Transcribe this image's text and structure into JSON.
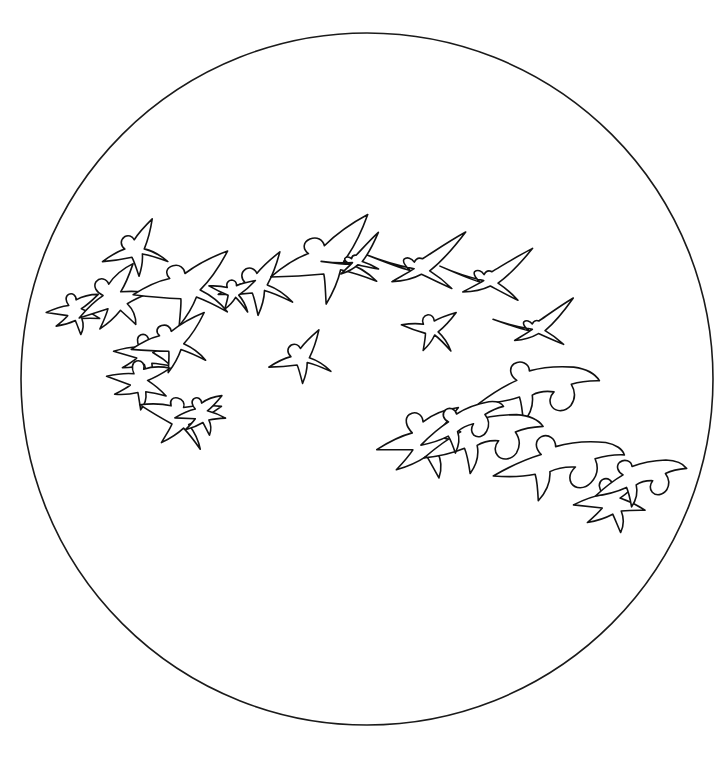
{
  "canvas": {
    "width": 728,
    "height": 763,
    "background_color": "#ffffff",
    "title": "Flock of birds seen through a circular field of view"
  },
  "field_of_view": {
    "name": "circular-viewfield",
    "shape": "circle",
    "center_x": 367,
    "center_y": 379,
    "radius": 346,
    "stroke_color": "#1a1a1a",
    "stroke_width": 1.6,
    "fill_color": "#ffffff"
  },
  "drawing": {
    "style": "hand-drawn ink outline",
    "stroke_color": "#111111",
    "stroke_width": 1.6,
    "fill_color": "#ffffff",
    "subject": "birds in flight",
    "bird_count": 25
  },
  "chart_data": {
    "type": "scatter",
    "xlabel": "",
    "ylabel": "",
    "xlim": [
      0,
      728
    ],
    "ylim": [
      0,
      763
    ],
    "grid": false,
    "legend": "none",
    "categories": [
      "bird"
    ],
    "annotations": [
      "circular field of view outline",
      "birds arranged in loose descending flock from left to right"
    ],
    "points": [
      {
        "id": "bird-01",
        "x": 136,
        "y": 256,
        "size": 42,
        "rotation": -18,
        "pose": "gull-soar",
        "flip": false
      },
      {
        "id": "bird-02",
        "x": 78,
        "y": 316,
        "size": 36,
        "rotation": 14,
        "pose": "goose-flap",
        "flip": false
      },
      {
        "id": "bird-03",
        "x": 121,
        "y": 303,
        "size": 50,
        "rotation": -12,
        "pose": "goose-flap",
        "flip": false
      },
      {
        "id": "bird-04",
        "x": 190,
        "y": 300,
        "size": 56,
        "rotation": -6,
        "pose": "gull-glide",
        "flip": false
      },
      {
        "id": "bird-05",
        "x": 257,
        "y": 292,
        "size": 48,
        "rotation": -12,
        "pose": "gull-soar",
        "flip": false
      },
      {
        "id": "bird-06",
        "x": 334,
        "y": 274,
        "size": 62,
        "rotation": -14,
        "pose": "gull-glide",
        "flip": false
      },
      {
        "id": "bird-07",
        "x": 421,
        "y": 271,
        "size": 54,
        "rotation": -8,
        "pose": "gull-thin",
        "flip": false
      },
      {
        "id": "bird-08",
        "x": 490,
        "y": 283,
        "size": 50,
        "rotation": -6,
        "pose": "gull-thin",
        "flip": false
      },
      {
        "id": "bird-09",
        "x": 429,
        "y": 334,
        "size": 36,
        "rotation": 10,
        "pose": "gull-soar",
        "flip": false
      },
      {
        "id": "bird-10",
        "x": 538,
        "y": 331,
        "size": 44,
        "rotation": -10,
        "pose": "gull-thin",
        "flip": false
      },
      {
        "id": "bird-11",
        "x": 148,
        "y": 360,
        "size": 40,
        "rotation": 22,
        "pose": "goose-flap",
        "flip": false
      },
      {
        "id": "bird-12",
        "x": 176,
        "y": 352,
        "size": 44,
        "rotation": -8,
        "pose": "gull-glide",
        "flip": false
      },
      {
        "id": "bird-13",
        "x": 142,
        "y": 388,
        "size": 42,
        "rotation": 26,
        "pose": "goose-flap",
        "flip": false
      },
      {
        "id": "bird-14",
        "x": 301,
        "y": 364,
        "size": 40,
        "rotation": -14,
        "pose": "gull-soar",
        "flip": false
      },
      {
        "id": "bird-15",
        "x": 178,
        "y": 428,
        "size": 44,
        "rotation": 20,
        "pose": "gull-glide",
        "flip": false
      },
      {
        "id": "bird-16",
        "x": 205,
        "y": 418,
        "size": 34,
        "rotation": 8,
        "pose": "goose-flap",
        "flip": false
      },
      {
        "id": "bird-17",
        "x": 537,
        "y": 397,
        "size": 62,
        "rotation": 8,
        "pose": "goose-soar",
        "flip": false
      },
      {
        "id": "bird-18",
        "x": 430,
        "y": 448,
        "size": 60,
        "rotation": 6,
        "pose": "goose-flap",
        "flip": false
      },
      {
        "id": "bird-19",
        "x": 482,
        "y": 447,
        "size": 62,
        "rotation": 4,
        "pose": "goose-soar",
        "flip": false
      },
      {
        "id": "bird-20",
        "x": 556,
        "y": 474,
        "size": 64,
        "rotation": 10,
        "pose": "goose-glide",
        "flip": false
      },
      {
        "id": "bird-21",
        "x": 616,
        "y": 508,
        "size": 48,
        "rotation": 12,
        "pose": "goose-flap",
        "flip": false
      },
      {
        "id": "bird-22",
        "x": 640,
        "y": 486,
        "size": 48,
        "rotation": 2,
        "pose": "goose-soar",
        "flip": false
      },
      {
        "id": "bird-23",
        "x": 462,
        "y": 432,
        "size": 44,
        "rotation": -6,
        "pose": "goose-glide",
        "flip": false
      },
      {
        "id": "bird-24",
        "x": 231,
        "y": 296,
        "size": 30,
        "rotation": 16,
        "pose": "gull-soar",
        "flip": false
      },
      {
        "id": "bird-25",
        "x": 357,
        "y": 263,
        "size": 34,
        "rotation": -22,
        "pose": "gull-thin",
        "flip": false
      }
    ]
  }
}
